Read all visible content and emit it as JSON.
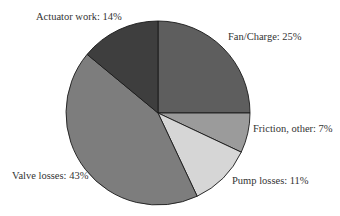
{
  "chart_data": {
    "type": "pie",
    "title": "",
    "start_angle_deg": 0,
    "direction": "clockwise",
    "slices": [
      {
        "label": "Fan/Charge",
        "value": 25,
        "display": "Fan/Charge: 25%",
        "color": "#5e5e5e"
      },
      {
        "label": "Friction, other",
        "value": 7,
        "display": "Friction, other: 7%",
        "color": "#9b9b9b"
      },
      {
        "label": "Pump losses",
        "value": 11,
        "display": "Pump losses: 11%",
        "color": "#d6d6d6"
      },
      {
        "label": "Valve losses",
        "value": 43,
        "display": "Valve losses: 43%",
        "color": "#7d7d7d"
      },
      {
        "label": "Actuator work",
        "value": 14,
        "display": "Actuator work: 14%",
        "color": "#3e3e3e"
      }
    ],
    "legend": "none",
    "labels_position": "outside"
  },
  "labels": {
    "fan": "Fan/Charge: 25%",
    "friction": "Friction, other: 7%",
    "pump": "Pump losses: 11%",
    "valve": "Valve losses: 43%",
    "actuator": "Actuator work: 14%"
  }
}
